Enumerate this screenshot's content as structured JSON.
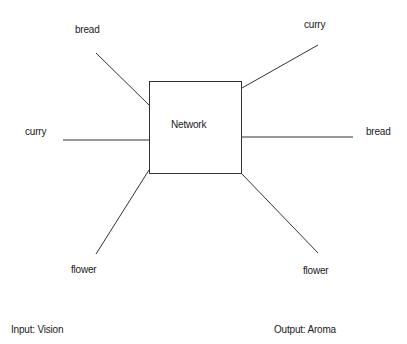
{
  "diagram": {
    "network": {
      "label": "Network"
    },
    "inputs": [
      {
        "label": "bread"
      },
      {
        "label": "curry"
      },
      {
        "label": "flower"
      }
    ],
    "outputs": [
      {
        "label": "curry"
      },
      {
        "label": "bread"
      },
      {
        "label": "flower"
      }
    ],
    "footer": {
      "input_caption": "Input: Vision",
      "output_caption": "Output: Aroma"
    },
    "colors": {
      "line": "#333333",
      "text": "#1a1a1a",
      "background": "#ffffff"
    }
  }
}
